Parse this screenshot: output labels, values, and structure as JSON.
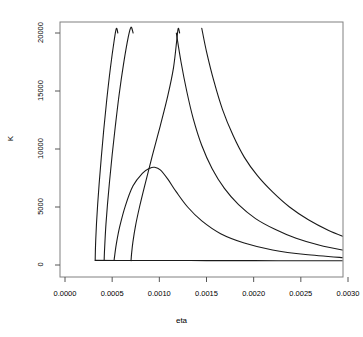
{
  "chart_data": {
    "type": "line",
    "title": "",
    "xlabel": "eta",
    "ylabel": "K",
    "xlim": [
      0.0,
      0.003
    ],
    "ylim": [
      0,
      20000
    ],
    "grid": false,
    "legend": "none",
    "xticks": [
      "0.0000",
      "0.0005",
      "0.0010",
      "0.0015",
      "0.0020",
      "0.0025",
      "0.0030"
    ],
    "xtick_values": [
      0.0,
      0.0005,
      0.001,
      0.0015,
      0.002,
      0.0025,
      0.003
    ],
    "yticks": [
      "0",
      "5000",
      "10000",
      "15000",
      "20000"
    ],
    "ytick_values": [
      0,
      5000,
      10000,
      15000,
      20000
    ],
    "line_color": "#1a1a1a",
    "line_width": 1.1,
    "frame_color": "#808080",
    "background": "#ffffff",
    "series": [
      {
        "name": "curve-1",
        "points": [
          [
            0.00032,
            400
          ],
          [
            0.000322,
            1200
          ],
          [
            0.000326,
            2200
          ],
          [
            0.000334,
            3600
          ],
          [
            0.000346,
            5200
          ],
          [
            0.000362,
            7000
          ],
          [
            0.000384,
            9200
          ],
          [
            0.00041,
            11600
          ],
          [
            0.000442,
            14200
          ],
          [
            0.00048,
            16900
          ],
          [
            0.000522,
            19400
          ],
          [
            0.000545,
            20400
          ],
          [
            0.00056,
            20000
          ]
        ]
      },
      {
        "name": "curve-2",
        "points": [
          [
            0.000415,
            390
          ],
          [
            0.000418,
            1100
          ],
          [
            0.000424,
            2100
          ],
          [
            0.000434,
            3500
          ],
          [
            0.00045,
            5200
          ],
          [
            0.000472,
            7200
          ],
          [
            0.0005,
            9500
          ],
          [
            0.000534,
            12000
          ],
          [
            0.000574,
            14700
          ],
          [
            0.00062,
            17300
          ],
          [
            0.000672,
            19700
          ],
          [
            0.0007,
            20500
          ],
          [
            0.000722,
            20000
          ]
        ]
      },
      {
        "name": "curve-3",
        "points": [
          [
            0.00052,
            390
          ],
          [
            0.000528,
            900
          ],
          [
            0.000546,
            1900
          ],
          [
            0.00058,
            3300
          ],
          [
            0.00064,
            5100
          ],
          [
            0.00072,
            6800
          ],
          [
            0.00082,
            7900
          ],
          [
            0.0009,
            8350
          ],
          [
            0.00095,
            8420
          ],
          [
            0.00101,
            8200
          ],
          [
            0.00109,
            7400
          ],
          [
            0.00118,
            6300
          ],
          [
            0.0013,
            5000
          ],
          [
            0.00145,
            3800
          ],
          [
            0.00165,
            2700
          ],
          [
            0.0019,
            1900
          ],
          [
            0.0022,
            1300
          ],
          [
            0.00255,
            900
          ],
          [
            0.003,
            600
          ]
        ]
      },
      {
        "name": "curve-4",
        "points": [
          [
            0.0007,
            380
          ],
          [
            0.000706,
            1000
          ],
          [
            0.00072,
            2000
          ],
          [
            0.000748,
            3400
          ],
          [
            0.00079,
            5000
          ],
          [
            0.00085,
            7000
          ],
          [
            0.000925,
            9400
          ],
          [
            0.00101,
            12000
          ],
          [
            0.00109,
            14600
          ],
          [
            0.00115,
            17000
          ],
          [
            0.001185,
            19400
          ],
          [
            0.0012,
            20400
          ],
          [
            0.001215,
            20000
          ]
        ]
      },
      {
        "name": "curve-5",
        "points": [
          [
            0.00118,
            20000
          ],
          [
            0.00123,
            17500
          ],
          [
            0.00129,
            15000
          ],
          [
            0.00136,
            12600
          ],
          [
            0.00145,
            10300
          ],
          [
            0.00156,
            8300
          ],
          [
            0.00169,
            6600
          ],
          [
            0.00184,
            5200
          ],
          [
            0.00202,
            4000
          ],
          [
            0.00222,
            3100
          ],
          [
            0.00245,
            2300
          ],
          [
            0.0027,
            1700
          ],
          [
            0.003,
            1200
          ]
        ]
      },
      {
        "name": "curve-6",
        "points": [
          [
            0.00145,
            20400
          ],
          [
            0.0015,
            18400
          ],
          [
            0.00158,
            15800
          ],
          [
            0.00167,
            13400
          ],
          [
            0.00178,
            11200
          ],
          [
            0.0019,
            9300
          ],
          [
            0.00204,
            7700
          ],
          [
            0.0022,
            6300
          ],
          [
            0.00238,
            5000
          ],
          [
            0.00258,
            3900
          ],
          [
            0.00279,
            3000
          ],
          [
            0.003,
            2300
          ]
        ]
      },
      {
        "name": "baseline-asymptote",
        "points": [
          [
            0.00032,
            400
          ],
          [
            0.0006,
            390
          ],
          [
            0.001,
            385
          ],
          [
            0.0015,
            380
          ],
          [
            0.002,
            375
          ],
          [
            0.0025,
            370
          ],
          [
            0.003,
            360
          ]
        ]
      }
    ]
  }
}
